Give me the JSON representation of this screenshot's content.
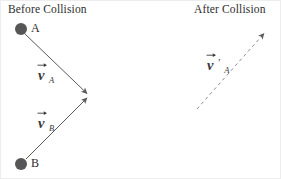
{
  "figure": {
    "width": 281,
    "height": 179,
    "background": "#ffffff",
    "border_color": "#ededed",
    "stroke_color": "#5a5a5a",
    "ball_color": "#565656",
    "text_color": "#2d2d2d"
  },
  "panels": {
    "before": {
      "title": "Before Collision",
      "balls": [
        {
          "label": "A",
          "cx": 20,
          "cy": 28,
          "r": 6
        },
        {
          "label": "B",
          "cx": 20,
          "cy": 163,
          "r": 6
        }
      ],
      "vectors": [
        {
          "name": "v-a",
          "symbol": "v",
          "subscript": "A",
          "prime": "",
          "style": "solid",
          "x1": 24,
          "y1": 33,
          "x2": 88,
          "y2": 93
        },
        {
          "name": "v-b",
          "symbol": "v",
          "subscript": "B",
          "prime": "",
          "style": "solid",
          "x1": 25,
          "y1": 158,
          "x2": 88,
          "y2": 97
        }
      ]
    },
    "after": {
      "title": "After Collision",
      "balls": [],
      "vectors": [
        {
          "name": "v-a-prime",
          "symbol": "v",
          "subscript": "A",
          "prime": "'",
          "style": "dashed",
          "x1": 196,
          "y1": 108,
          "x2": 266,
          "y2": 29
        }
      ]
    }
  }
}
